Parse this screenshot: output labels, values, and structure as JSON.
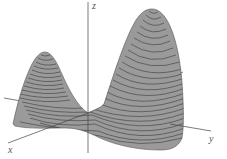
{
  "figure": {
    "type": "3d-surface",
    "axes": {
      "x_label": "x",
      "y_label": "y",
      "z_label": "z"
    },
    "colors": {
      "surface": "#9a9a9a",
      "contour": "#3a3a3a",
      "axis": "#444444",
      "label": "#555555",
      "background": "#ffffff"
    },
    "contour_count": 24
  }
}
